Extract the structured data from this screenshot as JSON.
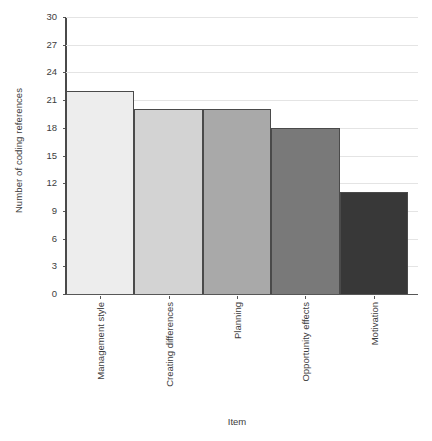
{
  "chart_data": {
    "type": "bar",
    "title": "",
    "subtitle": "",
    "xlabel": "Item",
    "ylabel": "Number of coding references",
    "categories": [
      "Management style",
      "Creating differences",
      "Planning",
      "Opportunity effects",
      "Motivation"
    ],
    "values": [
      22,
      20,
      20,
      18,
      11
    ],
    "ylim": [
      0,
      30
    ],
    "yticks": [
      0,
      3,
      6,
      9,
      12,
      15,
      18,
      21,
      24,
      27,
      30
    ],
    "ytick_labels": [
      "0",
      "3",
      "6",
      "9",
      "12",
      "15",
      "18",
      "21",
      "24",
      "27",
      "30"
    ],
    "grid": true,
    "grid_axis": "y",
    "legend": false,
    "bar_colors": [
      "#ededed",
      "#d3d3d3",
      "#a9a9a9",
      "#797979",
      "#383838"
    ],
    "bar_edge_color": "#4a4a4a",
    "grid_color": "#e4e4e4",
    "axis_color": "#4a4a4a",
    "background_color": "#ffffff",
    "text_color": "#3d3d3d"
  }
}
